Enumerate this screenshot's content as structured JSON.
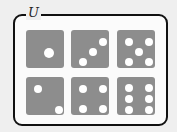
{
  "label": "U",
  "colors": {
    "die": "#8d8d8d",
    "pip": "#ffffff",
    "outline": "#111111"
  },
  "dice": [
    {
      "value": 1,
      "x": 26,
      "y": 30,
      "pips": [
        [
          19,
          19,
          10
        ]
      ]
    },
    {
      "value": 3,
      "x": 71,
      "y": 30,
      "pips": [
        [
          28,
          8,
          8
        ],
        [
          18,
          18,
          8
        ],
        [
          8,
          28,
          8
        ]
      ]
    },
    {
      "value": 5,
      "x": 117,
      "y": 30,
      "pips": [
        [
          8,
          8,
          8
        ],
        [
          28,
          8,
          8
        ],
        [
          18,
          18,
          8
        ],
        [
          8,
          28,
          8
        ],
        [
          28,
          28,
          8
        ]
      ]
    },
    {
      "value": 2,
      "x": 26,
      "y": 77,
      "pips": [
        [
          8,
          8,
          8
        ],
        [
          29,
          29,
          8
        ]
      ]
    },
    {
      "value": 4,
      "x": 71,
      "y": 77,
      "pips": [
        [
          8,
          8,
          8
        ],
        [
          28,
          8,
          8
        ],
        [
          8,
          28,
          8
        ],
        [
          28,
          28,
          8
        ]
      ]
    },
    {
      "value": 6,
      "x": 117,
      "y": 77,
      "pips": [
        [
          8,
          7,
          8
        ],
        [
          28,
          7,
          8
        ],
        [
          8,
          18,
          8
        ],
        [
          28,
          18,
          8
        ],
        [
          8,
          29,
          8
        ],
        [
          28,
          29,
          8
        ]
      ]
    }
  ]
}
